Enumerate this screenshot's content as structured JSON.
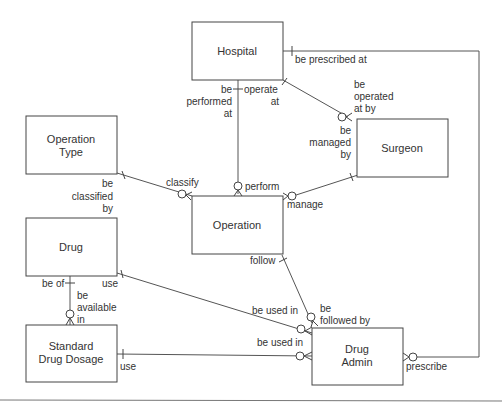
{
  "diagram": {
    "type": "entity-relationship",
    "entities": [
      {
        "id": "hospital",
        "label": [
          "Hospital"
        ]
      },
      {
        "id": "surgeon",
        "label": [
          "Surgeon"
        ]
      },
      {
        "id": "operation_type",
        "label": [
          "Operation",
          "Type"
        ]
      },
      {
        "id": "operation",
        "label": [
          "Operation"
        ]
      },
      {
        "id": "drug",
        "label": [
          "Drug"
        ]
      },
      {
        "id": "standard_drug_dosage",
        "label": [
          "Standard",
          "Drug Dosage"
        ]
      },
      {
        "id": "drug_admin",
        "label": [
          "Drug",
          "Admin"
        ]
      }
    ],
    "relationships": [
      {
        "from": "hospital",
        "to": "operation",
        "from_label": [
          "be",
          "performed",
          "at"
        ],
        "to_label": [
          "perform"
        ],
        "from_card": "one",
        "to_card": "zero-or-many"
      },
      {
        "from": "hospital",
        "to": "surgeon",
        "from_label": [
          "operate",
          "at"
        ],
        "to_label": [
          "be",
          "operated",
          "at by"
        ],
        "from_card": "one",
        "to_card": "zero-or-many"
      },
      {
        "from": "hospital",
        "to": "drug_admin",
        "from_label": [
          "be prescribed at"
        ],
        "to_label": [
          "prescribe"
        ],
        "from_card": "one",
        "to_card": "zero-or-many"
      },
      {
        "from": "surgeon",
        "to": "operation",
        "from_label": [
          "be",
          "managed",
          "by"
        ],
        "to_label": [
          "manage"
        ],
        "from_card": "one",
        "to_card": "zero-or-many"
      },
      {
        "from": "operation_type",
        "to": "operation",
        "from_label": [
          "be",
          "classified",
          "by"
        ],
        "to_label": [
          "classify"
        ],
        "from_card": "one",
        "to_card": "zero-or-many"
      },
      {
        "from": "operation",
        "to": "drug_admin",
        "from_label": [
          "follow"
        ],
        "to_label": [
          "be",
          "followed by"
        ],
        "from_card": "one",
        "to_card": "zero-or-many"
      },
      {
        "from": "drug",
        "to": "drug_admin",
        "from_label": [
          "use"
        ],
        "to_label": [
          "be used in"
        ],
        "from_card": "one",
        "to_card": "zero-or-many"
      },
      {
        "from": "drug",
        "to": "standard_drug_dosage",
        "from_label": [
          "be of"
        ],
        "to_label": [
          "be",
          "available",
          "in"
        ],
        "from_card": "one",
        "to_card": "zero-or-many"
      },
      {
        "from": "standard_drug_dosage",
        "to": "drug_admin",
        "from_label": [
          "use"
        ],
        "to_label": [
          "be used in"
        ],
        "from_card": "one",
        "to_card": "zero-or-many"
      }
    ]
  },
  "labels": {
    "hospital": "Hospital",
    "surgeon": "Surgeon",
    "operation_type_1": "Operation",
    "operation_type_2": "Type",
    "operation": "Operation",
    "drug": "Drug",
    "sdd_1": "Standard",
    "sdd_2": "Drug Dosage",
    "drug_admin_1": "Drug",
    "drug_admin_2": "Admin",
    "be_prescribed_at": "be prescribed at",
    "operate": "operate",
    "at": "at",
    "be": "be",
    "performed": "performed",
    "operated": "operated",
    "at_by": "at by",
    "managed": "managed",
    "by": "by",
    "classified": "classified",
    "classify": "classify",
    "perform": "perform",
    "manage": "manage",
    "follow": "follow",
    "use": "use",
    "be_of": "be of",
    "available": "available",
    "in": "in",
    "be_used_in": "be used in",
    "followed_by": "followed by",
    "prescribe": "prescribe"
  }
}
